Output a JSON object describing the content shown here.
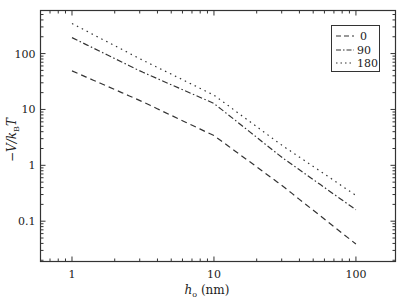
{
  "chart_data": {
    "type": "line",
    "title": "",
    "xlabel": "h_o (nm)",
    "xlabel_main": "h",
    "xlabel_sub": "o",
    "xlabel_unit": " (nm)",
    "ylabel": "−V/k_B T",
    "ylabel_parts": {
      "pre": "−V/k",
      "sub": "B",
      "post": "T"
    },
    "xscale": "log",
    "yscale": "log",
    "xlim": [
      0.6,
      190
    ],
    "ylim": [
      0.019,
      590
    ],
    "x_ticks": [
      1,
      10,
      100
    ],
    "x_tick_labels": [
      "1",
      "10",
      "100"
    ],
    "y_ticks": [
      0.1,
      1,
      10,
      100
    ],
    "y_tick_labels": [
      "0.1",
      "1",
      "10",
      "100"
    ],
    "grid": false,
    "legend_position": "upper right",
    "x": [
      1,
      3,
      10,
      30,
      100
    ],
    "series": [
      {
        "name": "0",
        "style": "dashed",
        "values": [
          49,
          14.5,
          3.4,
          0.44,
          0.039
        ]
      },
      {
        "name": "90",
        "style": "dashdot",
        "values": [
          193,
          49,
          12.8,
          1.4,
          0.16
        ]
      },
      {
        "name": "180",
        "style": "dotted",
        "values": [
          345,
          81,
          18,
          2.3,
          0.29
        ]
      }
    ]
  }
}
